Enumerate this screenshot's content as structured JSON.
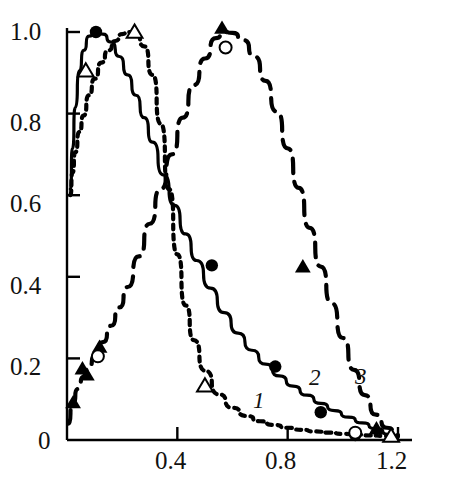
{
  "chart_data": {
    "type": "line",
    "title": "",
    "xlabel": "",
    "ylabel": "",
    "xlim": [
      0.0,
      1.25
    ],
    "ylim": [
      0.0,
      1.04
    ],
    "grid": false,
    "legend_position": "inline-curve-labels",
    "x_ticks": [
      {
        "value": 0.4,
        "label": "0.4"
      },
      {
        "value": 0.8,
        "label": "0.8"
      },
      {
        "value": 1.2,
        "label": "1.2"
      }
    ],
    "y_ticks": [
      {
        "value": 0.0,
        "label": "0"
      },
      {
        "value": 0.2,
        "label": "0.2"
      },
      {
        "value": 0.4,
        "label": "0.4"
      },
      {
        "value": 0.6,
        "label": "0.6"
      },
      {
        "value": 0.8,
        "label": "0.8"
      },
      {
        "value": 1.0,
        "label": "1.0"
      }
    ],
    "annotations": [
      {
        "text": "1",
        "x": 0.69,
        "y": 0.095,
        "style": "italic"
      },
      {
        "text": "2",
        "x": 0.9,
        "y": 0.16,
        "style": "italic"
      },
      {
        "text": "3",
        "x": 1.06,
        "y": 0.155,
        "style": "italic"
      }
    ],
    "series": [
      {
        "name": "1",
        "line_style": "dotted",
        "color": "#000000",
        "marker": "open-triangle",
        "x": [
          0.012,
          0.02,
          0.03,
          0.045,
          0.06,
          0.08,
          0.1,
          0.125,
          0.15,
          0.175,
          0.2,
          0.22,
          0.25,
          0.28,
          0.31,
          0.34,
          0.37,
          0.4,
          0.43,
          0.46,
          0.5,
          0.55,
          0.6,
          0.65,
          0.7,
          0.75,
          0.8,
          0.85,
          0.9,
          0.95,
          1.0,
          1.05,
          1.1,
          1.15,
          1.2
        ],
        "y": [
          0.6,
          0.655,
          0.705,
          0.755,
          0.795,
          0.845,
          0.885,
          0.925,
          0.955,
          0.978,
          0.995,
          1.0,
          0.995,
          0.965,
          0.895,
          0.775,
          0.615,
          0.455,
          0.33,
          0.245,
          0.17,
          0.112,
          0.079,
          0.059,
          0.046,
          0.037,
          0.03,
          0.025,
          0.021,
          0.018,
          0.015,
          0.013,
          0.011,
          0.01,
          0.009
        ],
        "markers": [
          {
            "x": 0.068,
            "y": 0.905
          },
          {
            "x": 0.245,
            "y": 1.0
          },
          {
            "x": 0.5,
            "y": 0.133
          },
          {
            "x": 1.175,
            "y": 0.01
          }
        ]
      },
      {
        "name": "2",
        "line_style": "solid",
        "color": "#000000",
        "marker": "filled-circle",
        "x": [
          0.012,
          0.02,
          0.03,
          0.045,
          0.06,
          0.08,
          0.105,
          0.13,
          0.16,
          0.19,
          0.22,
          0.25,
          0.28,
          0.31,
          0.35,
          0.39,
          0.43,
          0.47,
          0.52,
          0.57,
          0.62,
          0.67,
          0.72,
          0.77,
          0.82,
          0.87,
          0.92,
          0.97,
          1.02,
          1.07,
          1.12,
          1.17,
          1.2
        ],
        "y": [
          0.615,
          0.715,
          0.815,
          0.905,
          0.955,
          0.99,
          1.0,
          0.995,
          0.975,
          0.94,
          0.895,
          0.845,
          0.79,
          0.73,
          0.65,
          0.575,
          0.505,
          0.44,
          0.372,
          0.312,
          0.262,
          0.22,
          0.186,
          0.157,
          0.132,
          0.11,
          0.09,
          0.072,
          0.056,
          0.042,
          0.028,
          0.014,
          0.008
        ],
        "markers": [
          {
            "x": 0.105,
            "y": 1.0
          },
          {
            "x": 0.525,
            "y": 0.428
          },
          {
            "x": 0.755,
            "y": 0.18
          },
          {
            "x": 0.92,
            "y": 0.068
          },
          {
            "x": 1.045,
            "y": 0.012
          }
        ]
      },
      {
        "name": "3",
        "line_style": "dashed",
        "color": "#000000",
        "marker": "filled-triangle",
        "x": [
          0.005,
          0.02,
          0.04,
          0.06,
          0.08,
          0.1,
          0.13,
          0.16,
          0.19,
          0.22,
          0.26,
          0.3,
          0.34,
          0.38,
          0.42,
          0.46,
          0.5,
          0.54,
          0.57,
          0.6,
          0.64,
          0.68,
          0.72,
          0.76,
          0.8,
          0.84,
          0.88,
          0.92,
          0.96,
          1.0,
          1.04,
          1.08,
          1.12,
          1.16,
          1.2
        ],
        "y": [
          0.04,
          0.09,
          0.125,
          0.155,
          0.18,
          0.205,
          0.24,
          0.28,
          0.325,
          0.375,
          0.45,
          0.53,
          0.615,
          0.7,
          0.79,
          0.87,
          0.935,
          0.985,
          1.0,
          0.998,
          0.98,
          0.94,
          0.88,
          0.805,
          0.715,
          0.618,
          0.52,
          0.425,
          0.335,
          0.25,
          0.172,
          0.11,
          0.062,
          0.03,
          0.012
        ],
        "markers": [
          {
            "x": 0.022,
            "y": 0.092
          },
          {
            "x": 0.056,
            "y": 0.175
          },
          {
            "x": 0.072,
            "y": 0.16
          },
          {
            "x": 0.118,
            "y": 0.228
          },
          {
            "x": 0.562,
            "y": 1.01
          },
          {
            "x": 0.855,
            "y": 0.425
          },
          {
            "x": 1.122,
            "y": 0.028
          }
        ],
        "open_markers": [
          {
            "x": 0.112,
            "y": 0.205,
            "marker": "open-circle"
          },
          {
            "x": 0.575,
            "y": 0.962,
            "marker": "open-circle"
          },
          {
            "x": 1.045,
            "y": 0.018,
            "marker": "open-circle"
          }
        ]
      }
    ]
  },
  "axis": {
    "x_tick_labels": [
      "0.4",
      "0.8",
      "1.2"
    ],
    "y_tick_labels": [
      "1.0",
      "0.8",
      "0.6",
      "0.4",
      "0.2",
      "0"
    ]
  },
  "curve_labels": {
    "one": "1",
    "two": "2",
    "three": "3"
  }
}
